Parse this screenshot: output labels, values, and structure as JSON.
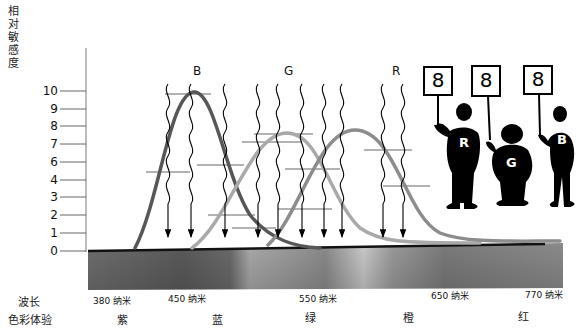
{
  "yaxis": {
    "title_chars": [
      "相",
      "对",
      "敏",
      "感",
      "度"
    ],
    "ticks": [
      {
        "label": "10",
        "y": 91
      },
      {
        "label": "9",
        "y": 109
      },
      {
        "label": "8",
        "y": 126
      },
      {
        "label": "7",
        "y": 144
      },
      {
        "label": "6",
        "y": 162
      },
      {
        "label": "4",
        "y": 180
      },
      {
        "label": "3",
        "y": 197
      },
      {
        "label": "2",
        "y": 215
      },
      {
        "label": "1",
        "y": 233
      },
      {
        "label": "0",
        "y": 251
      }
    ]
  },
  "curves": [
    {
      "name": "B",
      "label": "B",
      "color": "#555555",
      "peak_x": 195,
      "peak_y": 93
    },
    {
      "name": "G",
      "label": "G",
      "color": "#a6a6a6",
      "peak_x": 287,
      "peak_y": 133
    },
    {
      "name": "R",
      "label": "R",
      "color": "#8a8a8a",
      "peak_x": 358,
      "peak_y": 129
    }
  ],
  "rows": {
    "wavelength_label": "波长",
    "color_label": "色彩体验"
  },
  "wavelengths": [
    {
      "label": "380 纳米",
      "x": 93
    },
    {
      "label": "450 纳米",
      "x": 168
    },
    {
      "label": "550 纳米",
      "x": 299
    },
    {
      "label": "650 纳米",
      "x": 431
    },
    {
      "label": "770 纳米",
      "x": 525
    }
  ],
  "color_experiences": [
    {
      "label": "紫",
      "x": 117
    },
    {
      "label": "蓝",
      "x": 212
    },
    {
      "label": "绿",
      "x": 305
    },
    {
      "label": "橙",
      "x": 403
    },
    {
      "label": "红",
      "x": 518
    }
  ],
  "figures": [
    {
      "sign": "8",
      "letter": "R"
    },
    {
      "sign": "8",
      "letter": "G"
    },
    {
      "sign": "8",
      "letter": "B"
    }
  ]
}
